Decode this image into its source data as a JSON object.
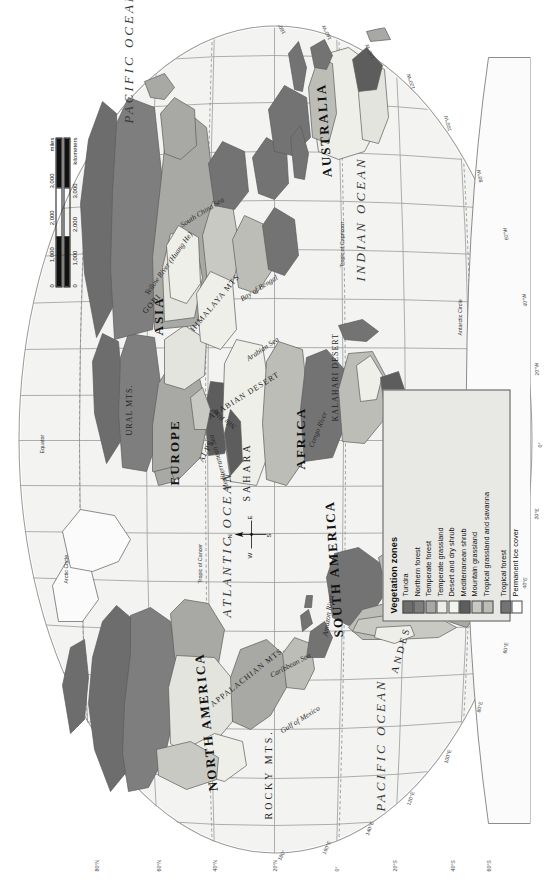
{
  "map": {
    "projection_title": "World Vegetation Zones",
    "continents": [
      {
        "name": "NORTH AMERICA",
        "x": 118,
        "y": 206
      },
      {
        "name": "SOUTH AMERICA",
        "x": 212,
        "y": 330
      },
      {
        "name": "EUROPE",
        "x": 430,
        "y": 168
      },
      {
        "name": "AFRICA",
        "x": 438,
        "y": 300
      },
      {
        "name": "ASIA",
        "x": 560,
        "y": 150
      },
      {
        "name": "AUSTRALIA",
        "x": 700,
        "y": 262
      }
    ],
    "oceans": [
      {
        "name": "PACIFIC OCEAN",
        "x": 96,
        "y": 360
      },
      {
        "name": "ATLANTIC OCEAN",
        "x": 268,
        "y": 215
      },
      {
        "name": "INDIAN OCEAN",
        "x": 640,
        "y": 350
      },
      {
        "name": "PACIFIC OCEAN",
        "x": 786,
        "y": 150
      }
    ],
    "physical_features": [
      {
        "name": "ROCKY MTS.",
        "x": 96,
        "y": 258
      },
      {
        "name": "APPALACHIAN MTS.",
        "x": 176,
        "y": 232
      },
      {
        "name": "ANDES MTS.",
        "x": 214,
        "y": 378
      },
      {
        "name": "ALPS",
        "x": 428,
        "y": 196
      },
      {
        "name": "URAL MTS.",
        "x": 470,
        "y": 124
      },
      {
        "name": "SAHARA",
        "x": 404,
        "y": 268
      },
      {
        "name": "ARABIAN DESERT",
        "x": 486,
        "y": 234
      },
      {
        "name": "KALAHARI DESERT",
        "x": 492,
        "y": 348
      },
      {
        "name": "HIMALAYA MTS",
        "x": 586,
        "y": 214
      },
      {
        "name": "GOBI",
        "x": 586,
        "y": 144
      }
    ],
    "seas": [
      {
        "name": "Gulf of Mexico",
        "x": 166,
        "y": 286
      },
      {
        "name": "Caribbean Sea",
        "x": 206,
        "y": 290
      },
      {
        "name": "Mediterranean Sea",
        "x": 432,
        "y": 226
      },
      {
        "name": "Arabian Sea",
        "x": 540,
        "y": 258
      },
      {
        "name": "Bay of Bengal",
        "x": 592,
        "y": 262
      },
      {
        "name": "South China Sea",
        "x": 650,
        "y": 204
      },
      {
        "name": "Yellow River (Huang He)",
        "x": 612,
        "y": 158
      },
      {
        "name": "Amazon River",
        "x": 240,
        "y": 324
      },
      {
        "name": "Nile River",
        "x": 470,
        "y": 250
      },
      {
        "name": "Congo River",
        "x": 452,
        "y": 312
      }
    ],
    "reference_lines": [
      {
        "label": "Equator",
        "y": 274
      },
      {
        "label": "Tropic of Cancer",
        "y": 212
      },
      {
        "label": "Tropic of Capricorn",
        "y": 336
      },
      {
        "label": "Arctic Circle",
        "y": 96
      },
      {
        "label": "Antarctic Circle",
        "y": 452
      }
    ],
    "longitude_labels": [
      "180°",
      "160°W",
      "140°W",
      "120°W",
      "100°W",
      "80°W",
      "60°W",
      "40°W",
      "20°W",
      "0°",
      "20°E",
      "40°E",
      "60°E",
      "80°E",
      "100°E",
      "120°E",
      "140°E",
      "160°E",
      "180°"
    ],
    "latitude_labels": [
      "80°N",
      "60°N",
      "40°N",
      "20°N",
      "0°",
      "20°S",
      "40°S",
      "60°S"
    ]
  },
  "legend": {
    "title": "Vegetation zones",
    "items": [
      {
        "label": "Tundra",
        "color": "#6d6d6d"
      },
      {
        "label": "Northern forest",
        "color": "#7e7e7e"
      },
      {
        "label": "Temperate forest",
        "color": "#a8a8a4"
      },
      {
        "label": "Temperate grassland",
        "color": "#eeeee8"
      },
      {
        "label": "Desert and dry shrub",
        "color": "#f4f4ee"
      },
      {
        "label": "Mediterranean shrub",
        "color": "#5d5d5d"
      },
      {
        "label": "Mountain grassland",
        "color": "#c9c9c4"
      },
      {
        "label": "Tropical grassland and savanna",
        "color": "#bdbdb7"
      },
      {
        "label": "Tropical forest",
        "color": "#737373"
      },
      {
        "label": "Permanent ice cover",
        "color": "#fdfdfd"
      }
    ]
  },
  "scale": {
    "miles_ticks": [
      "0",
      "1,000",
      "2,000",
      "3,000"
    ],
    "miles_unit": "miles",
    "km_ticks": [
      "0",
      "1,000",
      "2,000",
      "3,000"
    ],
    "km_unit": "kilometers"
  },
  "compass": {
    "n": "N",
    "e": "E",
    "s": "S",
    "w": "W"
  }
}
